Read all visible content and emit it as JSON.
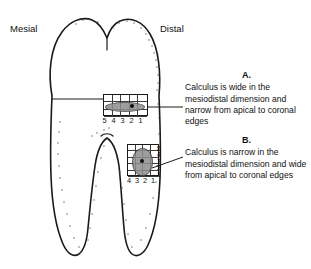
{
  "figure": {
    "orientation_labels": {
      "mesial": "Mesial",
      "distal": "Distal"
    },
    "callouts": [
      {
        "id": "a",
        "letter": "A.",
        "text": "Calculus is wide in the mesiodistal dimension and narrow from apical to coronal edges"
      },
      {
        "id": "b",
        "letter": "B.",
        "text": "Calculus is narrow in the mesiodistal dimension and wide from apical to coronal edges"
      }
    ],
    "grids": [
      {
        "id": "grid-a",
        "label": "A",
        "columns": 5,
        "rows": 3,
        "bottom_numbers": [
          "5",
          "4",
          "3",
          "2",
          "1"
        ],
        "side_numbers": [],
        "deposit_shape": "wide-flat-oval",
        "deposit_color": "#8e8e8e"
      },
      {
        "id": "grid-b",
        "label": "B",
        "columns": 4,
        "rows": 5,
        "bottom_numbers": [
          "4",
          "3",
          "2",
          "1"
        ],
        "side_numbers": [
          "5",
          "4",
          "3",
          "2",
          "1"
        ],
        "deposit_shape": "tall-narrow-oval",
        "deposit_color": "#8e8e8e"
      }
    ],
    "colors": {
      "outline": "#1a1a1a",
      "grid_line": "#3a3a3a",
      "deposit": "#8e8e8e",
      "background": "#ffffff",
      "text": "#111111"
    }
  }
}
